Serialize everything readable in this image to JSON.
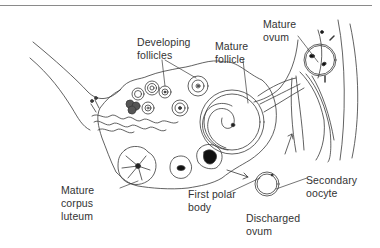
{
  "diagram": {
    "style": "black-and-white line drawing",
    "labels": {
      "developing_follicles": "Developing\nfollicles",
      "mature_follicle": "Mature\nfollicle",
      "mature_ovum": "Mature\novum",
      "mature_corpus_luteum": "Mature\ncorpus\nluteum",
      "first_polar_body": "First polar\nbody",
      "secondary_oocyte": "Secondary\noocyte",
      "discharged_ovum": "Discharged\novum"
    },
    "colors": {
      "line": "#3a3a3a",
      "text": "#333333",
      "background": "#ffffff",
      "rule": "#8a8a8a"
    }
  }
}
